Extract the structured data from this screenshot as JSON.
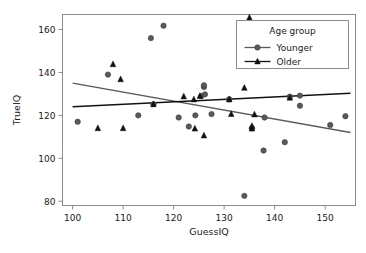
{
  "chart_data": {
    "type": "scatter",
    "title": "",
    "xlabel": "GuessIQ",
    "ylabel": "TrueIQ",
    "xlim": [
      98,
      156
    ],
    "ylim": [
      78,
      167
    ],
    "xticks": [
      100,
      110,
      120,
      130,
      140,
      150
    ],
    "yticks": [
      80,
      100,
      120,
      140,
      160
    ],
    "grid": false,
    "legend": {
      "title": "Age group",
      "position": "upper right",
      "entries": [
        {
          "name": "Younger",
          "marker": "circle",
          "color": "#5a5a5a"
        },
        {
          "name": "Older",
          "marker": "triangle",
          "color": "#111111"
        }
      ]
    },
    "series": [
      {
        "name": "Younger",
        "marker": "circle",
        "color": "#5a5a5a",
        "points": [
          {
            "x": 101.0,
            "y": 117.0
          },
          {
            "x": 107.0,
            "y": 139.0
          },
          {
            "x": 113.0,
            "y": 120.0
          },
          {
            "x": 115.5,
            "y": 156.0
          },
          {
            "x": 116.0,
            "y": 125.2
          },
          {
            "x": 118.0,
            "y": 161.8
          },
          {
            "x": 121.0,
            "y": 119.0
          },
          {
            "x": 123.0,
            "y": 114.8
          },
          {
            "x": 124.3,
            "y": 120.0
          },
          {
            "x": 125.5,
            "y": 129.0
          },
          {
            "x": 126.0,
            "y": 133.2
          },
          {
            "x": 126.0,
            "y": 134.0
          },
          {
            "x": 126.2,
            "y": 129.8
          },
          {
            "x": 127.5,
            "y": 120.6
          },
          {
            "x": 131.0,
            "y": 127.5
          },
          {
            "x": 134.0,
            "y": 82.5
          },
          {
            "x": 135.5,
            "y": 114.0
          },
          {
            "x": 137.8,
            "y": 103.6
          },
          {
            "x": 138.0,
            "y": 119.0
          },
          {
            "x": 142.0,
            "y": 107.5
          },
          {
            "x": 143.0,
            "y": 128.7
          },
          {
            "x": 145.0,
            "y": 129.2
          },
          {
            "x": 145.0,
            "y": 124.5
          },
          {
            "x": 151.0,
            "y": 115.5
          },
          {
            "x": 154.0,
            "y": 119.6
          }
        ],
        "fit_line": {
          "x0": 100.0,
          "y0": 135.0,
          "x1": 155.0,
          "y1": 112.0,
          "color": "#5a5a5a"
        }
      },
      {
        "name": "Older",
        "marker": "triangle",
        "color": "#111111",
        "points": [
          {
            "x": 105.0,
            "y": 114.0
          },
          {
            "x": 108.0,
            "y": 143.8
          },
          {
            "x": 109.5,
            "y": 136.8
          },
          {
            "x": 110.0,
            "y": 114.0
          },
          {
            "x": 116.0,
            "y": 125.2
          },
          {
            "x": 122.0,
            "y": 128.8
          },
          {
            "x": 124.0,
            "y": 127.4
          },
          {
            "x": 124.2,
            "y": 113.8
          },
          {
            "x": 125.2,
            "y": 129.0
          },
          {
            "x": 126.0,
            "y": 110.6
          },
          {
            "x": 131.0,
            "y": 127.4
          },
          {
            "x": 131.4,
            "y": 120.6
          },
          {
            "x": 134.0,
            "y": 132.8
          },
          {
            "x": 135.0,
            "y": 165.5
          },
          {
            "x": 135.5,
            "y": 113.8
          },
          {
            "x": 135.5,
            "y": 115.0
          },
          {
            "x": 136.0,
            "y": 120.4
          },
          {
            "x": 143.0,
            "y": 128.2
          }
        ],
        "fit_line": {
          "x0": 100.0,
          "y0": 124.0,
          "x1": 155.0,
          "y1": 130.3,
          "color": "#111111"
        }
      }
    ]
  }
}
